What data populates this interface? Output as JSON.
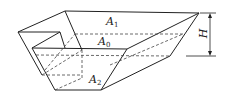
{
  "figure": {
    "line_color": "#222222",
    "labels": {
      "top_area": {
        "symbol": "A",
        "sub": "1"
      },
      "mid_area": {
        "symbol": "A",
        "sub": "0"
      },
      "bottom_area": {
        "symbol": "A",
        "sub": "2"
      },
      "height": "H"
    }
  }
}
